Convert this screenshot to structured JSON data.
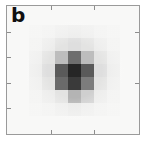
{
  "panel": {
    "label": "b",
    "background_color": "#f8f8f7",
    "frame_color": "#9a9a9a",
    "tick_color": "#8d8d8d"
  },
  "chart_data": {
    "type": "heatmap",
    "title": "b",
    "xlabel": "",
    "ylabel": "",
    "grid": false,
    "legend": "none",
    "colormap": "grayscale-inverted",
    "value_range": [
      0,
      1
    ],
    "cols": 7,
    "rows": 7,
    "x": [
      1,
      2,
      3,
      4,
      5,
      6,
      7
    ],
    "y": [
      1,
      2,
      3,
      4,
      5,
      6,
      7
    ],
    "values": [
      [
        0.02,
        0.03,
        0.05,
        0.06,
        0.05,
        0.03,
        0.02
      ],
      [
        0.03,
        0.06,
        0.1,
        0.13,
        0.1,
        0.06,
        0.03
      ],
      [
        0.05,
        0.1,
        0.28,
        0.57,
        0.28,
        0.1,
        0.05
      ],
      [
        0.06,
        0.13,
        0.6,
        0.85,
        0.6,
        0.13,
        0.06
      ],
      [
        0.05,
        0.1,
        0.52,
        0.75,
        0.45,
        0.1,
        0.05
      ],
      [
        0.03,
        0.06,
        0.1,
        0.3,
        0.18,
        0.06,
        0.03
      ],
      [
        0.02,
        0.03,
        0.05,
        0.07,
        0.05,
        0.03,
        0.02
      ]
    ],
    "cell_colors": [
      [
        "#f4f4f3",
        "#f1f1f0",
        "#ededec",
        "#ebebea",
        "#ededec",
        "#f1f1f0",
        "#f4f4f3"
      ],
      [
        "#f1f1f0",
        "#ebebea",
        "#e3e3e2",
        "#dedede",
        "#e3e3e2",
        "#ebebea",
        "#f1f1f0"
      ],
      [
        "#ededec",
        "#e3e3e2",
        "#bdbdbd",
        "#6e6e6e",
        "#bdbdbd",
        "#e3e3e2",
        "#ededec"
      ],
      [
        "#ebebea",
        "#dedede",
        "#5a5a5a",
        "#262626",
        "#5a5a5a",
        "#dedede",
        "#ebebea"
      ],
      [
        "#ededec",
        "#e3e3e2",
        "#6a6a6a",
        "#3a3a3a",
        "#7c7c7c",
        "#e3e3e2",
        "#ededec"
      ],
      [
        "#f1f1f0",
        "#ebebea",
        "#e3e3e2",
        "#b4b4b4",
        "#cfcfcf",
        "#ebebea",
        "#f1f1f0"
      ],
      [
        "#f4f4f3",
        "#f1f1f0",
        "#ededec",
        "#e9e9e8",
        "#ededec",
        "#f1f1f0",
        "#f4f4f3"
      ]
    ],
    "annotations": [
      {
        "text": "b",
        "position": "top-left"
      }
    ]
  },
  "axes": {
    "ticks_top": [
      33,
      66
    ],
    "ticks_bottom": [
      33,
      66
    ],
    "ticks_left": [
      20,
      40,
      60,
      80
    ],
    "ticks_right": [
      20,
      60
    ],
    "tick_labels": []
  }
}
